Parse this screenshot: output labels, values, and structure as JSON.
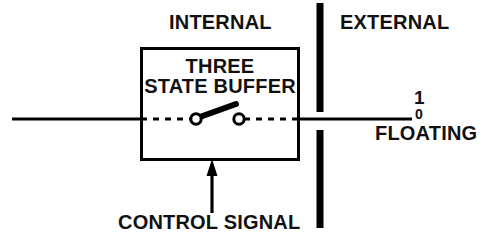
{
  "diagram": {
    "type": "schematic",
    "colors": {
      "line": "#000000",
      "text": "#111111",
      "background": "#ffffff"
    },
    "labels": {
      "internal": "INTERNAL",
      "external": "EXTERNAL",
      "control_signal": "CONTROL SIGNAL",
      "floating": "FLOATING",
      "logic_high": "1",
      "logic_low": "0"
    },
    "block": {
      "line1": "THREE",
      "line2": "STATE BUFFER",
      "x": 141,
      "y": 48,
      "width": 158,
      "height": 112
    },
    "boundary": {
      "name": "internal-external-boundary",
      "x": 320,
      "segments": [
        {
          "y1": 3,
          "y2": 112
        },
        {
          "y1": 130,
          "y2": 228
        }
      ],
      "thickness": 7
    },
    "wires": {
      "input": {
        "x1": 12,
        "x2": 141,
        "y": 119,
        "style": "solid"
      },
      "internal_dash_left": {
        "x1": 141,
        "x2": 196,
        "y": 119,
        "style": "dashed"
      },
      "internal_dash_right": {
        "x1": 239,
        "x2": 299,
        "y": 119,
        "style": "dashed"
      },
      "output": {
        "x1": 299,
        "x2": 412,
        "y": 119,
        "style": "solid"
      },
      "control": {
        "x": 212,
        "y1": 160,
        "y2": 213,
        "style": "solid",
        "arrow": "up"
      }
    },
    "switch": {
      "name": "three-state-switch",
      "pivot": {
        "x": 196,
        "y": 119
      },
      "contact": {
        "x": 239,
        "y": 119
      },
      "lever_tip": {
        "x": 235,
        "y": 104
      },
      "state": "open"
    }
  }
}
